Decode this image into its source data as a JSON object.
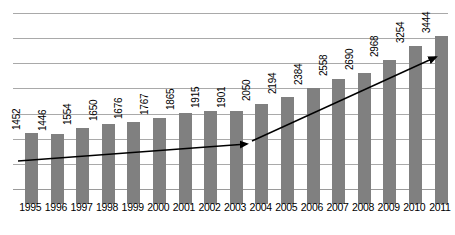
{
  "chart_data": {
    "type": "bar",
    "title": "",
    "subtitle": "",
    "xlabel": "",
    "ylabel": "",
    "categories": [
      "1995",
      "1996",
      "1997",
      "1998",
      "1999",
      "2000",
      "2001",
      "2002",
      "2003",
      "2004",
      "2005",
      "2006",
      "2007",
      "2008",
      "2009",
      "2010",
      "2011"
    ],
    "values": [
      1452,
      1446,
      1554,
      1650,
      1676,
      1767,
      1865,
      1915,
      1901,
      2050,
      2194,
      2384,
      2558,
      2690,
      2968,
      3254,
      3444
    ],
    "data_labels": [
      "1452",
      "1446",
      "1554",
      "1650",
      "1676",
      "1767",
      "1865",
      "1915",
      "1901",
      "2050",
      "2194",
      "2384",
      "2558",
      "2690",
      "2968",
      "3254",
      "3444"
    ],
    "series": [
      {
        "name": "",
        "values": [
          1452,
          1446,
          1554,
          1650,
          1676,
          1767,
          1865,
          1915,
          1901,
          2050,
          2194,
          2384,
          2558,
          2690,
          2968,
          3254,
          3444
        ]
      }
    ],
    "ylim": [
      0,
      3800
    ],
    "grid": true,
    "gridlines": 8,
    "legend": "none",
    "bar_color": "#808080",
    "gridline_color": "#a9a9a9",
    "annotations": [
      {
        "name": "trend-arrow-early",
        "type": "arrow",
        "from_category": "1995",
        "to_category": "2004",
        "note": "shallow upward trend arrow"
      },
      {
        "name": "trend-arrow-late",
        "type": "arrow",
        "from_category": "2004",
        "to_category": "2011",
        "note": "steep upward trend arrow"
      }
    ]
  }
}
